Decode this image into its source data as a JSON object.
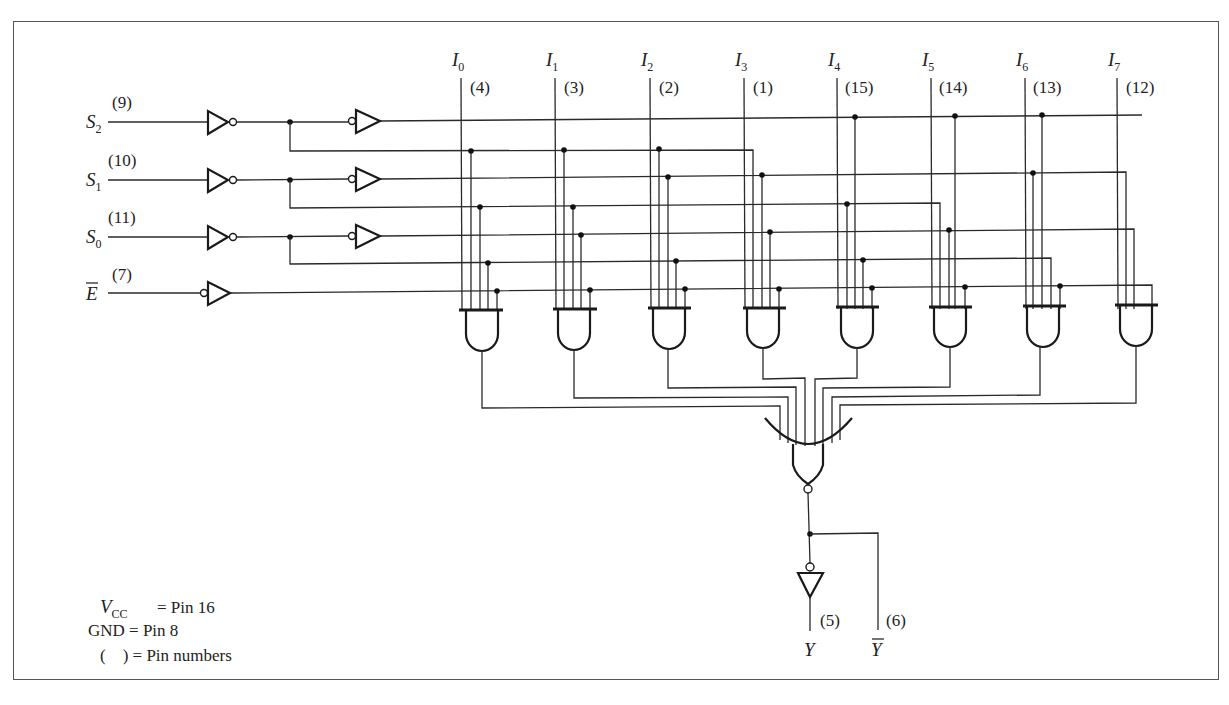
{
  "diagram": {
    "selects": [
      {
        "name": "S",
        "sub": "2",
        "pin": "(9)"
      },
      {
        "name": "S",
        "sub": "1",
        "pin": "(10)"
      },
      {
        "name": "S",
        "sub": "0",
        "pin": "(11)"
      }
    ],
    "enable": {
      "name": "E",
      "overbar": true,
      "pin": "(7)"
    },
    "data_inputs": [
      {
        "name": "I",
        "sub": "0",
        "pin": "(4)"
      },
      {
        "name": "I",
        "sub": "1",
        "pin": "(3)"
      },
      {
        "name": "I",
        "sub": "2",
        "pin": "(2)"
      },
      {
        "name": "I",
        "sub": "3",
        "pin": "(1)"
      },
      {
        "name": "I",
        "sub": "4",
        "pin": "(15)"
      },
      {
        "name": "I",
        "sub": "5",
        "pin": "(14)"
      },
      {
        "name": "I",
        "sub": "6",
        "pin": "(13)"
      },
      {
        "name": "I",
        "sub": "7",
        "pin": "(12)"
      }
    ],
    "outputs": [
      {
        "name": "Y",
        "overbar": false,
        "pin": "(5)"
      },
      {
        "name": "Y",
        "overbar": true,
        "pin": "(6)"
      }
    ],
    "legend": {
      "vcc_label": "V",
      "vcc_sub": "CC",
      "vcc_value": "= Pin 16",
      "gnd": "GND = Pin 8",
      "pins": "(    ) = Pin numbers"
    },
    "colors": {
      "ink": "#1a1a1a",
      "background": "#ffffff",
      "frame": "#555555"
    }
  }
}
